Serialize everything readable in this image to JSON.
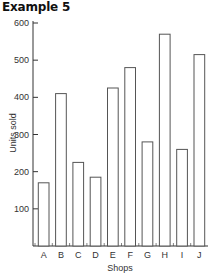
{
  "title": "Example 5",
  "chart_data": {
    "type": "bar",
    "title": "Example 5",
    "xlabel": "Shops",
    "ylabel": "Units sold",
    "categories": [
      "A",
      "B",
      "C",
      "D",
      "E",
      "F",
      "G",
      "H",
      "I",
      "J"
    ],
    "values": [
      170,
      410,
      225,
      185,
      425,
      480,
      280,
      570,
      260,
      515
    ],
    "ylim": [
      0,
      600
    ],
    "yticks": [
      100,
      200,
      300,
      400,
      500,
      600
    ],
    "grid": false,
    "legend": null,
    "bar_style": "outline",
    "colors": {
      "bar_stroke": "#555555",
      "bar_fill": "#ffffff",
      "axis": "#333333"
    }
  }
}
